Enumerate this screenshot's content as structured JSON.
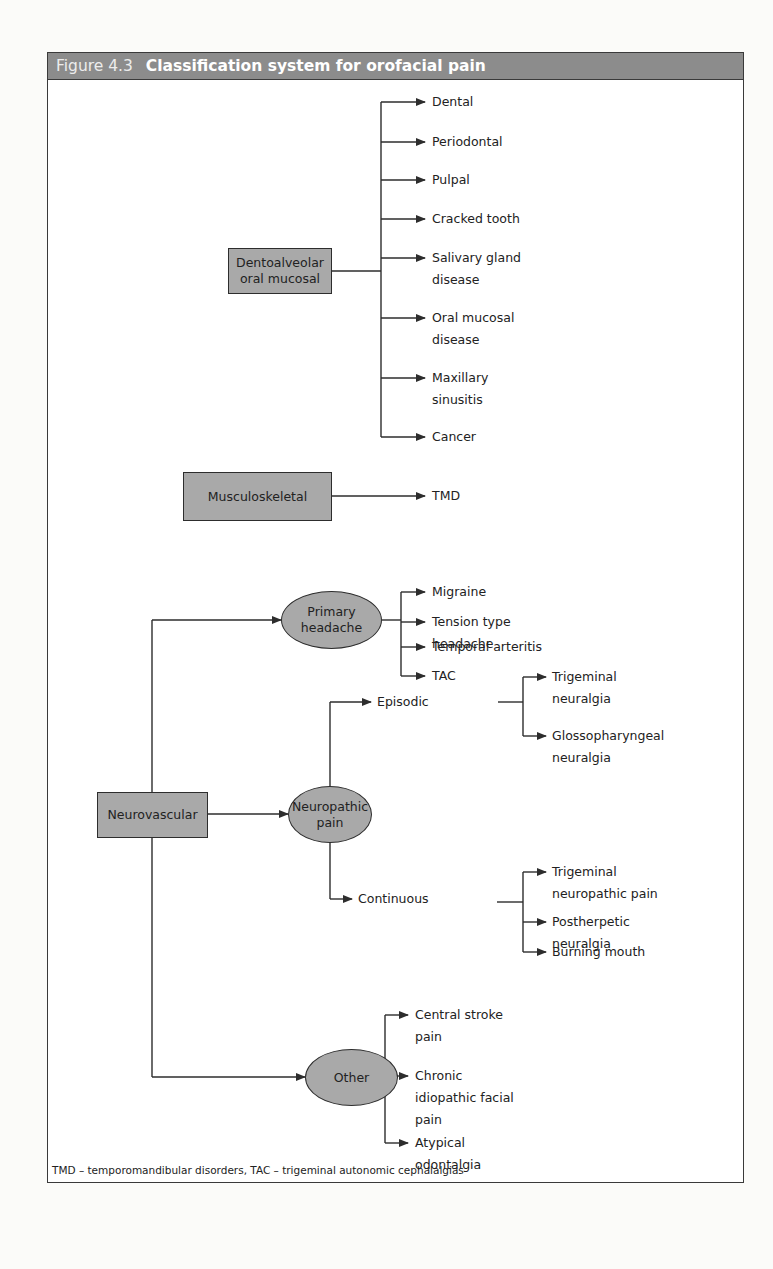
{
  "figure": {
    "number": "Figure 4.3",
    "title": "Classification system for orofacial pain",
    "footnote": "TMD – temporomandibular disorders, TAC – trigeminal autonomic cephalalgias"
  },
  "colors": {
    "header_bg": "#8c8c8c",
    "node_fill": "#a9a9a9",
    "line": "#2d2d2d"
  },
  "categories": {
    "dentoalveolar": {
      "label_line1": "Dentoalveolar",
      "label_line2": "oral mucosal",
      "children": [
        {
          "line1": "Dental"
        },
        {
          "line1": "Periodontal"
        },
        {
          "line1": "Pulpal"
        },
        {
          "line1": "Cracked tooth"
        },
        {
          "line1": "Salivary gland",
          "line2": "disease"
        },
        {
          "line1": "Oral mucosal",
          "line2": "disease"
        },
        {
          "line1": "Maxillary",
          "line2": "sinusitis"
        },
        {
          "line1": "Cancer"
        }
      ]
    },
    "musculoskeletal": {
      "label": "Musculoskeletal",
      "children": [
        {
          "line1": "TMD"
        }
      ]
    },
    "neurovascular": {
      "label": "Neurovascular",
      "primary_headache": {
        "label_line1": "Primary",
        "label_line2": "headache",
        "children": [
          {
            "line1": "Migraine"
          },
          {
            "line1": "Tension type",
            "line2": "headache"
          },
          {
            "line1": "Temporal arteritis"
          },
          {
            "line1": "TAC"
          }
        ]
      },
      "neuropathic_pain": {
        "label_line1": "Neuropathic",
        "label_line2": "pain",
        "episodic": {
          "label": "Episodic",
          "children": [
            {
              "line1": "Trigeminal",
              "line2": "neuralgia"
            },
            {
              "line1": "Glossopharyngeal",
              "line2": "neuralgia"
            }
          ]
        },
        "continuous": {
          "label": "Continuous",
          "children": [
            {
              "line1": "Trigeminal",
              "line2": "neuropathic pain"
            },
            {
              "line1": "Postherpetic",
              "line2": "neuralgia"
            },
            {
              "line1": "Burning mouth"
            }
          ]
        }
      },
      "other": {
        "label": "Other",
        "children": [
          {
            "line1": "Central stroke",
            "line2": "pain"
          },
          {
            "line1": "Chronic",
            "line2": "idiopathic facial",
            "line3": "pain"
          },
          {
            "line1": "Atypical",
            "line2": "odontalgia"
          }
        ]
      }
    }
  }
}
